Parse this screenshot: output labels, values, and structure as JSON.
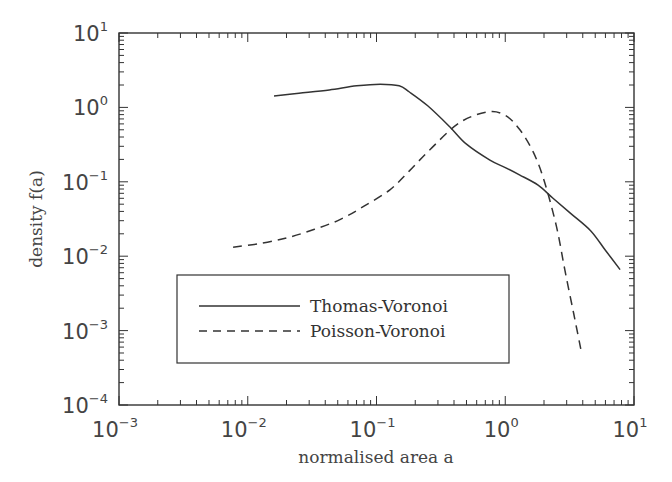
{
  "chart_data": {
    "type": "line",
    "title": "",
    "xlabel": "normalised area a",
    "ylabel": "density f(a)",
    "xscale": "log",
    "yscale": "log",
    "xlim": [
      0.001,
      10
    ],
    "ylim": [
      0.0001,
      10
    ],
    "grid": false,
    "legend_position": "lower left (inside)",
    "x_ticks": [
      {
        "base": "10",
        "exp": "−3",
        "value": 0.001
      },
      {
        "base": "10",
        "exp": "−2",
        "value": 0.01
      },
      {
        "base": "10",
        "exp": "−1",
        "value": 0.1
      },
      {
        "base": "10",
        "exp": "0",
        "value": 1
      },
      {
        "base": "10",
        "exp": "1",
        "value": 10
      }
    ],
    "y_ticks": [
      {
        "base": "10",
        "exp": "−4",
        "value": 0.0001
      },
      {
        "base": "10",
        "exp": "−3",
        "value": 0.001
      },
      {
        "base": "10",
        "exp": "−2",
        "value": 0.01
      },
      {
        "base": "10",
        "exp": "−1",
        "value": 0.1
      },
      {
        "base": "10",
        "exp": "0",
        "value": 1
      },
      {
        "base": "10",
        "exp": "1",
        "value": 10
      }
    ],
    "series": [
      {
        "name": "Thomas-Voronoi",
        "style": "solid",
        "color": "#333333",
        "x": [
          0.016,
          0.025,
          0.043,
          0.07,
          0.107,
          0.15,
          0.18,
          0.25,
          0.37,
          0.5,
          0.76,
          1.0,
          1.3,
          1.8,
          2.35,
          3.2,
          4.6,
          6.0,
          7.8
        ],
        "y": [
          1.42,
          1.55,
          1.72,
          1.95,
          2.05,
          1.95,
          1.61,
          1.05,
          0.55,
          0.32,
          0.196,
          0.155,
          0.123,
          0.09,
          0.06,
          0.038,
          0.022,
          0.012,
          0.0066
        ]
      },
      {
        "name": "Poisson-Voronoi",
        "style": "dashed",
        "color": "#333333",
        "x": [
          0.0077,
          0.013,
          0.021,
          0.033,
          0.052,
          0.08,
          0.127,
          0.18,
          0.26,
          0.44,
          0.73,
          1.0,
          1.3,
          1.65,
          2.0,
          2.5,
          2.9,
          3.4,
          3.9
        ],
        "y": [
          0.0132,
          0.015,
          0.018,
          0.023,
          0.031,
          0.047,
          0.078,
          0.14,
          0.27,
          0.62,
          0.87,
          0.78,
          0.5,
          0.25,
          0.105,
          0.025,
          0.0066,
          0.0017,
          0.00052
        ]
      }
    ]
  }
}
